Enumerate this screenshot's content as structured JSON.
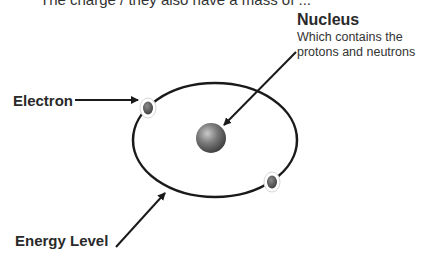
{
  "header": {
    "clipped_text": "The charge / they also have a mass of ..."
  },
  "labels": {
    "nucleus_title": "Nucleus",
    "nucleus_desc_line1": "Which contains the",
    "nucleus_desc_line2": "protons and neutrons",
    "electron": "Electron",
    "energy_level": "Energy Level"
  },
  "diagram": {
    "orbit": {
      "cx": 215,
      "cy": 140,
      "rx": 82,
      "ry": 57,
      "color": "#1a1a1a"
    },
    "nucleus": {
      "cx": 211,
      "cy": 138,
      "r": 15,
      "color": "#6e6e6e"
    },
    "electrons": [
      {
        "cx": 148,
        "cy": 108
      },
      {
        "cx": 272,
        "cy": 182
      }
    ],
    "arrows": {
      "nucleus": {
        "x1": 296,
        "y1": 52,
        "x2": 224,
        "y2": 125
      },
      "electron": {
        "x1": 75,
        "y1": 100,
        "x2": 137,
        "y2": 100
      },
      "energy_level": {
        "x1": 116,
        "y1": 247,
        "x2": 165,
        "y2": 192
      }
    }
  }
}
